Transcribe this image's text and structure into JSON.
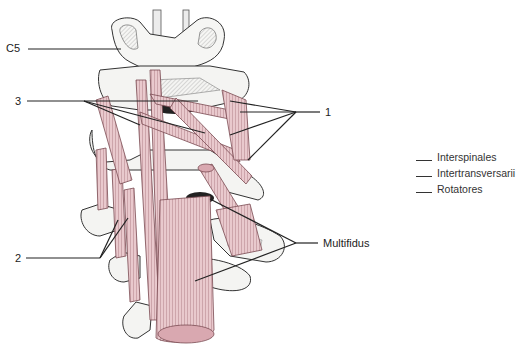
{
  "figure": {
    "labels": {
      "c5": "C5",
      "three": "3",
      "one": "1",
      "two": "2",
      "multifidus": "Multifidus"
    },
    "legend": [
      {
        "key": "1",
        "text": "Interspinales"
      },
      {
        "key": "2",
        "text": "Intertransversarii"
      },
      {
        "key": "3",
        "text": "Rotatores"
      }
    ],
    "colors": {
      "muscle": "#e8c8cc",
      "muscle_stroke": "#7a4a52",
      "bone": "#f4f4f2",
      "bone_stroke": "#444444",
      "leader": "#222222"
    }
  }
}
